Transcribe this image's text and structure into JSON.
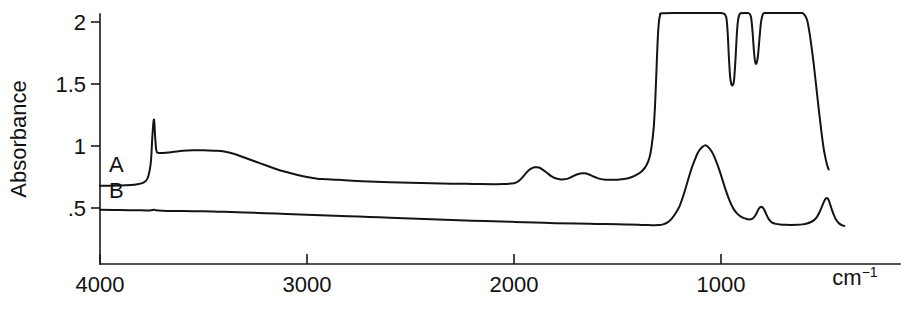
{
  "chart_data": {
    "type": "line",
    "title": "",
    "xlabel": "cm⁻¹",
    "ylabel": "Absorbance",
    "xlim": [
      4000,
      400
    ],
    "ylim": [
      0.28,
      2.12
    ],
    "x_reversed": true,
    "grid": false,
    "legend_position": "inline-left",
    "xticks": [
      4000,
      3000,
      2000,
      1000
    ],
    "xticklabels": [
      "4000",
      "3000",
      "2000",
      "1000"
    ],
    "yticks": [
      2,
      1.5,
      1,
      0.5
    ],
    "yticklabels": [
      "2",
      "1.5",
      "1",
      ".5"
    ],
    "annotations": [
      {
        "text": "A",
        "x": 3960,
        "y": 0.79
      },
      {
        "text": "B",
        "x": 3960,
        "y": 0.58
      },
      {
        "text": "cm⁻¹",
        "x": 600,
        "y": 0.18
      }
    ],
    "series": [
      {
        "name": "A",
        "label": "A",
        "color": "#141414",
        "description": "Upper spectrum: broad OH band with sharp free-OH spike near 3740, saturated plateau above 2.05 below 1300 with notches near 900 and 780",
        "points": [
          [
            4000,
            0.68
          ],
          [
            3900,
            0.682
          ],
          [
            3850,
            0.686
          ],
          [
            3820,
            0.692
          ],
          [
            3790,
            0.705
          ],
          [
            3770,
            0.74
          ],
          [
            3755,
            0.86
          ],
          [
            3748,
            1.05
          ],
          [
            3742,
            1.19
          ],
          [
            3738,
            1.2
          ],
          [
            3733,
            1.06
          ],
          [
            3728,
            0.965
          ],
          [
            3720,
            0.945
          ],
          [
            3700,
            0.944
          ],
          [
            3650,
            0.952
          ],
          [
            3600,
            0.962
          ],
          [
            3550,
            0.966
          ],
          [
            3500,
            0.966
          ],
          [
            3450,
            0.962
          ],
          [
            3400,
            0.955
          ],
          [
            3350,
            0.935
          ],
          [
            3300,
            0.905
          ],
          [
            3250,
            0.875
          ],
          [
            3200,
            0.845
          ],
          [
            3150,
            0.815
          ],
          [
            3100,
            0.79
          ],
          [
            3050,
            0.768
          ],
          [
            3000,
            0.75
          ],
          [
            2950,
            0.736
          ],
          [
            2920,
            0.733
          ],
          [
            2900,
            0.731
          ],
          [
            2850,
            0.727
          ],
          [
            2800,
            0.722
          ],
          [
            2700,
            0.714
          ],
          [
            2600,
            0.708
          ],
          [
            2500,
            0.703
          ],
          [
            2400,
            0.699
          ],
          [
            2300,
            0.696
          ],
          [
            2200,
            0.694
          ],
          [
            2100,
            0.692
          ],
          [
            2050,
            0.693
          ],
          [
            2000,
            0.7
          ],
          [
            1980,
            0.715
          ],
          [
            1960,
            0.745
          ],
          [
            1940,
            0.785
          ],
          [
            1920,
            0.815
          ],
          [
            1900,
            0.828
          ],
          [
            1880,
            0.826
          ],
          [
            1860,
            0.808
          ],
          [
            1840,
            0.782
          ],
          [
            1820,
            0.757
          ],
          [
            1800,
            0.74
          ],
          [
            1780,
            0.732
          ],
          [
            1760,
            0.731
          ],
          [
            1740,
            0.737
          ],
          [
            1720,
            0.752
          ],
          [
            1700,
            0.768
          ],
          [
            1680,
            0.779
          ],
          [
            1660,
            0.78
          ],
          [
            1640,
            0.772
          ],
          [
            1620,
            0.757
          ],
          [
            1600,
            0.743
          ],
          [
            1580,
            0.733
          ],
          [
            1560,
            0.728
          ],
          [
            1540,
            0.727
          ],
          [
            1500,
            0.728
          ],
          [
            1460,
            0.736
          ],
          [
            1430,
            0.75
          ],
          [
            1400,
            0.775
          ],
          [
            1380,
            0.8
          ],
          [
            1360,
            0.845
          ],
          [
            1345,
            0.91
          ],
          [
            1335,
            1.0
          ],
          [
            1325,
            1.15
          ],
          [
            1318,
            1.35
          ],
          [
            1312,
            1.6
          ],
          [
            1306,
            1.85
          ],
          [
            1300,
            2.0
          ],
          [
            1294,
            2.055
          ],
          [
            1285,
            2.07
          ],
          [
            1200,
            2.072
          ],
          [
            1100,
            2.072
          ],
          [
            1020,
            2.072
          ],
          [
            990,
            2.07
          ],
          [
            975,
            2.04
          ],
          [
            968,
            1.92
          ],
          [
            962,
            1.72
          ],
          [
            956,
            1.56
          ],
          [
            950,
            1.5
          ],
          [
            944,
            1.49
          ],
          [
            937,
            1.53
          ],
          [
            930,
            1.7
          ],
          [
            924,
            1.89
          ],
          [
            918,
            2.01
          ],
          [
            912,
            2.055
          ],
          [
            905,
            2.07
          ],
          [
            880,
            2.072
          ],
          [
            865,
            2.07
          ],
          [
            855,
            2.04
          ],
          [
            848,
            1.93
          ],
          [
            841,
            1.77
          ],
          [
            835,
            1.68
          ],
          [
            829,
            1.665
          ],
          [
            822,
            1.72
          ],
          [
            815,
            1.85
          ],
          [
            808,
            1.98
          ],
          [
            802,
            2.04
          ],
          [
            795,
            2.068
          ],
          [
            780,
            2.072
          ],
          [
            700,
            2.072
          ],
          [
            620,
            2.072
          ],
          [
            600,
            2.065
          ],
          [
            585,
            2.02
          ],
          [
            575,
            1.94
          ],
          [
            565,
            1.83
          ],
          [
            552,
            1.66
          ],
          [
            540,
            1.48
          ],
          [
            528,
            1.3
          ],
          [
            516,
            1.13
          ],
          [
            505,
            0.99
          ],
          [
            495,
            0.9
          ],
          [
            487,
            0.845
          ],
          [
            480,
            0.81
          ]
        ]
      },
      {
        "name": "B",
        "label": "B",
        "color": "#141414",
        "description": "Lower spectrum: near-flat sloping baseline with band near 1100, small peak near 800 and sharp peak near 470",
        "points": [
          [
            4000,
            0.485
          ],
          [
            3900,
            0.483
          ],
          [
            3800,
            0.481
          ],
          [
            3760,
            0.48
          ],
          [
            3740,
            0.486
          ],
          [
            3730,
            0.482
          ],
          [
            3700,
            0.478
          ],
          [
            3650,
            0.476
          ],
          [
            3600,
            0.475
          ],
          [
            3550,
            0.474
          ],
          [
            3500,
            0.473
          ],
          [
            3450,
            0.471
          ],
          [
            3400,
            0.469
          ],
          [
            3300,
            0.464
          ],
          [
            3200,
            0.458
          ],
          [
            3100,
            0.452
          ],
          [
            3000,
            0.446
          ],
          [
            2900,
            0.44
          ],
          [
            2800,
            0.434
          ],
          [
            2700,
            0.428
          ],
          [
            2600,
            0.422
          ],
          [
            2500,
            0.416
          ],
          [
            2400,
            0.41
          ],
          [
            2300,
            0.404
          ],
          [
            2200,
            0.398
          ],
          [
            2100,
            0.393
          ],
          [
            2000,
            0.388
          ],
          [
            1900,
            0.383
          ],
          [
            1800,
            0.378
          ],
          [
            1700,
            0.374
          ],
          [
            1600,
            0.371
          ],
          [
            1500,
            0.368
          ],
          [
            1450,
            0.366
          ],
          [
            1400,
            0.364
          ],
          [
            1350,
            0.362
          ],
          [
            1320,
            0.361
          ],
          [
            1300,
            0.362
          ],
          [
            1280,
            0.368
          ],
          [
            1260,
            0.382
          ],
          [
            1240,
            0.41
          ],
          [
            1220,
            0.455
          ],
          [
            1200,
            0.515
          ],
          [
            1185,
            0.585
          ],
          [
            1170,
            0.665
          ],
          [
            1155,
            0.75
          ],
          [
            1140,
            0.83
          ],
          [
            1125,
            0.895
          ],
          [
            1112,
            0.945
          ],
          [
            1100,
            0.975
          ],
          [
            1088,
            0.995
          ],
          [
            1078,
            1.005
          ],
          [
            1068,
            1.0
          ],
          [
            1058,
            0.985
          ],
          [
            1045,
            0.955
          ],
          [
            1030,
            0.905
          ],
          [
            1015,
            0.84
          ],
          [
            1000,
            0.765
          ],
          [
            985,
            0.685
          ],
          [
            970,
            0.61
          ],
          [
            955,
            0.545
          ],
          [
            940,
            0.495
          ],
          [
            925,
            0.46
          ],
          [
            910,
            0.437
          ],
          [
            895,
            0.423
          ],
          [
            880,
            0.414
          ],
          [
            868,
            0.409
          ],
          [
            856,
            0.409
          ],
          [
            845,
            0.418
          ],
          [
            835,
            0.438
          ],
          [
            826,
            0.465
          ],
          [
            818,
            0.492
          ],
          [
            810,
            0.507
          ],
          [
            802,
            0.508
          ],
          [
            794,
            0.494
          ],
          [
            786,
            0.468
          ],
          [
            778,
            0.438
          ],
          [
            770,
            0.412
          ],
          [
            760,
            0.392
          ],
          [
            748,
            0.379
          ],
          [
            735,
            0.372
          ],
          [
            715,
            0.367
          ],
          [
            690,
            0.364
          ],
          [
            660,
            0.363
          ],
          [
            630,
            0.364
          ],
          [
            605,
            0.368
          ],
          [
            585,
            0.375
          ],
          [
            568,
            0.385
          ],
          [
            552,
            0.4
          ],
          [
            538,
            0.425
          ],
          [
            526,
            0.46
          ],
          [
            514,
            0.505
          ],
          [
            504,
            0.545
          ],
          [
            496,
            0.572
          ],
          [
            490,
            0.581
          ],
          [
            484,
            0.575
          ],
          [
            477,
            0.552
          ],
          [
            470,
            0.515
          ],
          [
            462,
            0.475
          ],
          [
            454,
            0.44
          ],
          [
            446,
            0.412
          ],
          [
            437,
            0.39
          ],
          [
            428,
            0.374
          ],
          [
            419,
            0.364
          ],
          [
            410,
            0.358
          ],
          [
            404,
            0.356
          ]
        ]
      }
    ]
  },
  "axes": {
    "y_axis_title": "Absorbance",
    "x_unit_base": "cm",
    "x_unit_exponent": "−1"
  }
}
